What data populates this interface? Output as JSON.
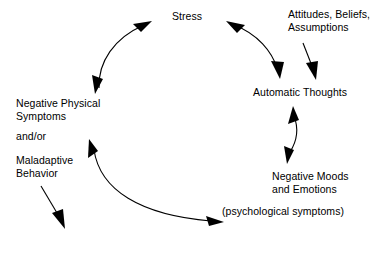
{
  "diagram": {
    "type": "cycle-diagram",
    "stroke_color": "#000000",
    "background_color": "#ffffff",
    "text_color": "#000000",
    "nodes": [
      {
        "id": "stress",
        "label": "Stress",
        "position": "top"
      },
      {
        "id": "attitudes",
        "label": "Attitudes, Beliefs,\nAssumptions",
        "position": "top-right"
      },
      {
        "id": "automatic_thoughts",
        "label": "Automatic Thoughts",
        "position": "right"
      },
      {
        "id": "negative_moods",
        "label": "Negative Moods\nand Emotions",
        "position": "bottom-right"
      },
      {
        "id": "psychological_symptoms",
        "label": "(psychological symptoms)",
        "position": "bottom-right-sub"
      },
      {
        "id": "negative_physical",
        "label": "Negative Physical\nSymptoms",
        "position": "left"
      },
      {
        "id": "andor",
        "label": "and/or",
        "position": "left-middle"
      },
      {
        "id": "maladaptive",
        "label": "Maladaptive\nBehavior",
        "position": "left-lower"
      }
    ],
    "connections": [
      {
        "id": "stress-physical",
        "from": "stress",
        "to": "negative_physical",
        "style": "curved",
        "heads": "double"
      },
      {
        "id": "stress-thoughts",
        "from": "stress",
        "to": "automatic_thoughts",
        "style": "curved",
        "heads": "double"
      },
      {
        "id": "attitudes-thoughts",
        "from": "attitudes",
        "to": "automatic_thoughts",
        "style": "straight",
        "heads": "single"
      },
      {
        "id": "thoughts-moods",
        "from": "automatic_thoughts",
        "to": "negative_moods",
        "style": "curved",
        "heads": "double"
      },
      {
        "id": "moods-physical",
        "from": "psychological_symptoms",
        "to": "maladaptive",
        "style": "curved",
        "heads": "double"
      },
      {
        "id": "maladaptive-out",
        "from": "maladaptive",
        "to": "external",
        "style": "straight",
        "heads": "single"
      }
    ]
  }
}
